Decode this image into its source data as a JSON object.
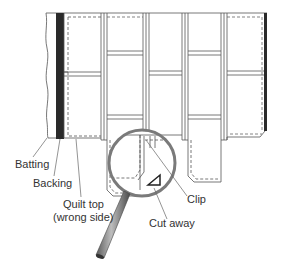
{
  "figure": {
    "colors": {
      "line": "#555555",
      "backing": "#2a2a2a",
      "magnifier_rim": "#777777",
      "handle": "#8a8a8a",
      "label": "#333333"
    }
  },
  "labels": {
    "batting": "Batting",
    "backing": "Backing",
    "quilt_top_line1": "Quilt top",
    "quilt_top_line2": "(wrong side)",
    "clip": "Clip",
    "cut_away": "Cut away"
  }
}
